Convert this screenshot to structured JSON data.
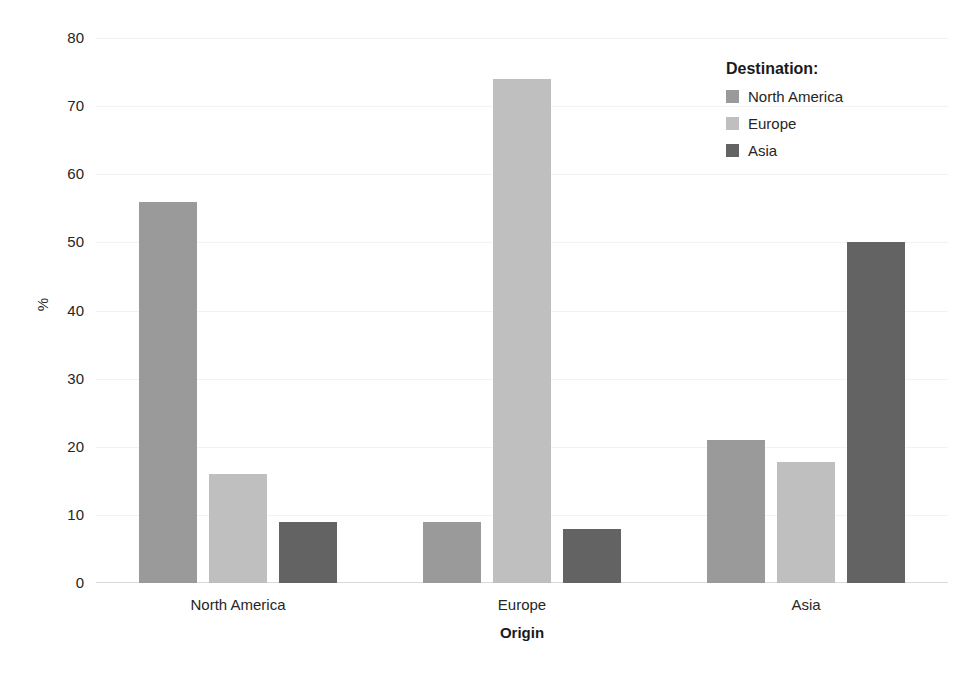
{
  "chart_data": {
    "type": "bar",
    "title": "",
    "subtitle": "",
    "xlabel": "Origin",
    "ylabel": "%",
    "categories": [
      "North America",
      "Europe",
      "Asia"
    ],
    "series": [
      {
        "name": "North America",
        "color": "#9a9a9a",
        "values": [
          56,
          9,
          21
        ]
      },
      {
        "name": "Europe",
        "color": "#bfbfbf",
        "values": [
          16,
          74,
          17.7
        ]
      },
      {
        "name": "Asia",
        "color": "#636363",
        "values": [
          9,
          8,
          50
        ]
      }
    ],
    "ylim": [
      0,
      80
    ],
    "yticks": [
      0,
      10,
      20,
      30,
      40,
      50,
      60,
      70,
      80
    ],
    "ytick_labels": [
      "0",
      "10",
      "20",
      "30",
      "40",
      "50",
      "60",
      "70",
      "80"
    ],
    "grid": true,
    "grid_color": "#f2f2f2",
    "legend_position": "right",
    "legend_title": "Destination:",
    "background": "#ffffff",
    "text_color": "#262626"
  },
  "legend": {
    "title": "Destination:",
    "items": [
      {
        "label": "North America",
        "color": "#9a9a9a"
      },
      {
        "label": "Europe",
        "color": "#bfbfbf"
      },
      {
        "label": "Asia",
        "color": "#636363"
      }
    ]
  },
  "axes": {
    "y_title": "%",
    "x_title": "Origin"
  }
}
